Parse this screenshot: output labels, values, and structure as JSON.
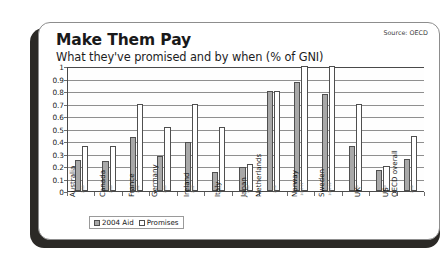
{
  "card": {
    "title": "Make Them Pay",
    "subtitle": "What they've promised and by when (% of GNI)",
    "source": "Source: OECD"
  },
  "legend": {
    "aid_label": "2004 Aid",
    "promises_label": "Promises"
  },
  "chart_data": {
    "type": "bar",
    "title": "Make Them Pay",
    "subtitle": "What they've promised and by when (% of GNI)",
    "xlabel": "",
    "ylabel": "% of GNI",
    "ylim": [
      0,
      1
    ],
    "yticks": [
      "0",
      "0.1",
      "0.2",
      "0.3",
      "0.4",
      "0.5",
      "0.6",
      "0.7",
      "0.8",
      "0.9",
      "1"
    ],
    "grid": true,
    "legend_position": "bottom-left",
    "categories": [
      "Australia",
      "Canada",
      "France",
      "Germany",
      "Ireland",
      "Italy",
      "Japan",
      "Netherlands",
      "Norway",
      "Sweden",
      "UK",
      "US",
      "OECD overall"
    ],
    "series": [
      {
        "name": "2004 Aid",
        "color": "#a8a8a8",
        "values": [
          0.25,
          0.24,
          0.43,
          0.28,
          0.39,
          0.15,
          0.19,
          0.8,
          0.87,
          0.78,
          0.36,
          0.17,
          0.26
        ]
      },
      {
        "name": "Promises",
        "color": "#ffffff",
        "values": [
          0.36,
          0.36,
          0.7,
          0.51,
          0.7,
          0.51,
          0.22,
          0.8,
          1.0,
          1.0,
          0.7,
          0.2,
          0.44
        ]
      }
    ],
    "promise_years": [
      "2010",
      "2010",
      "2012",
      "2010",
      "2007",
      "2010",
      "2010",
      "2006",
      "2006-07",
      "2006-09",
      "2013",
      "2010",
      "2006"
    ]
  }
}
